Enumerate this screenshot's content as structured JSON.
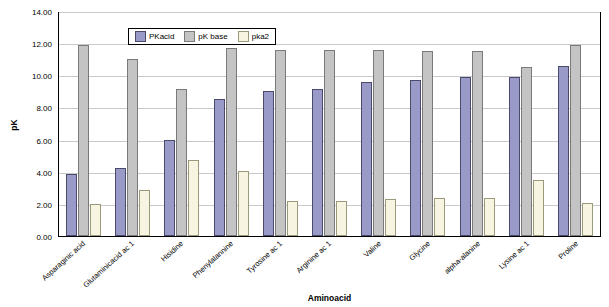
{
  "chart_data": {
    "type": "bar",
    "title": "Pk aminoacids",
    "xlabel": "Aminoacid",
    "ylabel": "pK",
    "ylim": [
      0.0,
      14.0
    ],
    "yticks": [
      "0.00",
      "2.00",
      "4.00",
      "6.00",
      "8.00",
      "10.00",
      "12.00",
      "14.00"
    ],
    "grid": true,
    "legend_position": "top-left-inside",
    "categories": [
      "Asparaginic acid",
      "Glutaminicacid ac 1",
      "Hisidine",
      "Phenylalannine",
      "Tyrosine ac 1",
      "Arginine ac 1",
      "Valine",
      "Glycine",
      "alpha-alanine",
      "Lysine ac 1",
      "Proline"
    ],
    "series": [
      {
        "name": "PKacid",
        "color": "#9a9ac8",
        "values": [
          3.9,
          4.3,
          6.0,
          8.6,
          9.1,
          9.2,
          9.7,
          9.8,
          10.0,
          10.0,
          10.7
        ]
      },
      {
        "name": "pK base",
        "color": "#c4c4c4",
        "values": [
          12.0,
          11.1,
          9.2,
          11.8,
          11.7,
          11.7,
          11.7,
          11.6,
          11.6,
          10.6,
          12.0
        ]
      },
      {
        "name": "pka2",
        "color": "#f7f5e2",
        "values": [
          2.0,
          2.9,
          4.8,
          4.1,
          2.2,
          2.2,
          2.3,
          2.4,
          2.4,
          3.5,
          2.1
        ]
      }
    ]
  }
}
